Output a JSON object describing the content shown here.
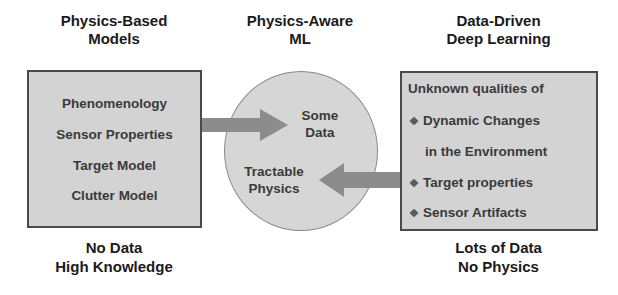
{
  "columns": {
    "left": {
      "heading": [
        "Physics-Based",
        "Models"
      ],
      "items": [
        "Phenomenology",
        "Sensor Properties",
        "Target Model",
        "Clutter Model"
      ],
      "footer": [
        "No Data",
        "High Knowledge"
      ]
    },
    "middle": {
      "heading": [
        "Physics-Aware",
        "ML"
      ],
      "upper_text": [
        "Some",
        "Data"
      ],
      "lower_text": [
        "Tractable",
        "Physics"
      ]
    },
    "right": {
      "heading": [
        "Data-Driven",
        "Deep Learning"
      ],
      "intro": "Unknown qualities of",
      "bullets": [
        {
          "icon": "diamond-bullet-icon",
          "line1": "Dynamic Changes",
          "line2": "in the Environment"
        },
        {
          "icon": "diamond-bullet-icon",
          "line1": "Target properties"
        },
        {
          "icon": "diamond-bullet-icon",
          "line1": "Sensor Artifacts"
        }
      ],
      "footer": [
        "Lots of Data",
        "No Physics"
      ]
    }
  },
  "arrows": [
    {
      "name": "physics-to-ml-arrow",
      "direction": "right"
    },
    {
      "name": "data-to-ml-arrow",
      "direction": "left"
    }
  ],
  "bullet_glyph": "❖",
  "colors": {
    "box_fill": "#d3d3d3",
    "box_border": "#4a4a4a",
    "arrow_fill": "#8c8c8c",
    "text_dark": "#1a1a1a",
    "text_box": "#3a3a3a"
  }
}
